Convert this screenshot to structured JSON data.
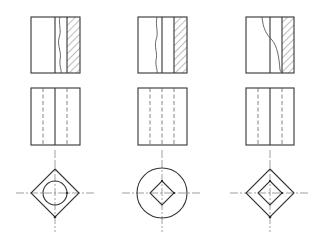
{
  "figure": {
    "columns": [
      {
        "id": "part-1",
        "front": {
          "x": 31,
          "y": 17,
          "w": 49,
          "h": 56,
          "inner_line_x": 55,
          "section_x": 67,
          "break": "wavy"
        },
        "side": {
          "x": 31,
          "y": 88,
          "w": 49,
          "h": 57,
          "solid_x": [
            55
          ],
          "hidden_x": [
            43,
            67
          ]
        },
        "top": {
          "cx": 55,
          "cy": 193,
          "outer": "square-diamond",
          "outer_r": 24,
          "inner": "circle",
          "inner_r": 12
        }
      },
      {
        "id": "part-2",
        "front": {
          "x": 138,
          "y": 17,
          "w": 49,
          "h": 56,
          "inner_line_x": 162,
          "section_x": 174,
          "break": "wavy"
        },
        "side": {
          "x": 138,
          "y": 88,
          "w": 49,
          "h": 57,
          "solid_x": [],
          "hidden_x": [
            150,
            162,
            174
          ]
        },
        "top": {
          "cx": 162,
          "cy": 193,
          "outer": "circle",
          "outer_r": 25,
          "inner": "square-diamond",
          "inner_r": 12
        }
      },
      {
        "id": "part-3",
        "front": {
          "x": 246,
          "y": 17,
          "w": 48,
          "h": 56,
          "inner_line_x": 270,
          "section_x": 282,
          "break": "s-curve"
        },
        "side": {
          "x": 246,
          "y": 88,
          "w": 48,
          "h": 57,
          "solid_x": [
            270
          ],
          "hidden_x": [
            258,
            282
          ]
        },
        "top": {
          "cx": 270,
          "cy": 193,
          "outer": "square-diamond",
          "outer_r": 24,
          "inner": "square-diamond",
          "inner_r": 12
        }
      }
    ],
    "colors": {
      "line": "#333333",
      "background": "#ffffff"
    }
  }
}
